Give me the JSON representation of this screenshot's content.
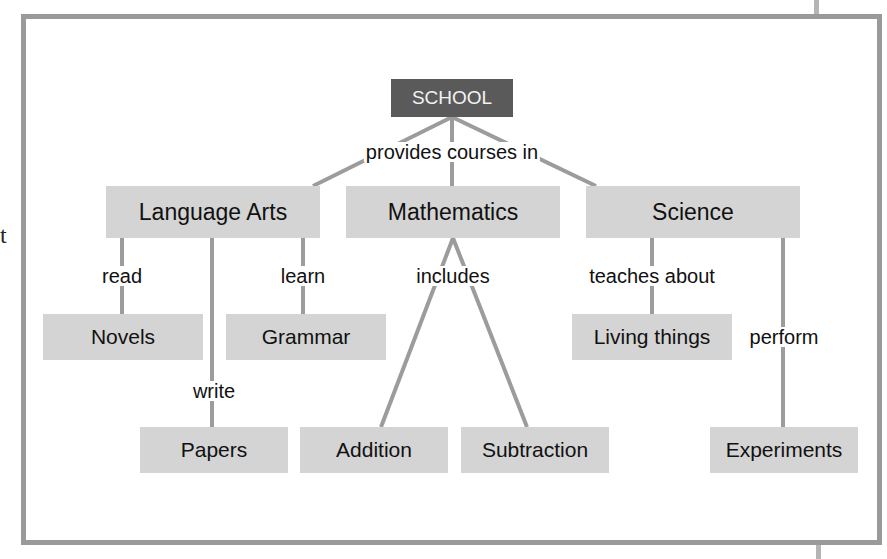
{
  "diagram": {
    "type": "concept-map",
    "colors": {
      "frame": "#9a9a9a",
      "node_fill": "#d4d4d4",
      "root_fill": "#5a5a5a",
      "root_text": "#f2f2f2",
      "link": "#999999"
    },
    "stray_text": "t",
    "root": {
      "id": "school",
      "label": "SCHOOL"
    },
    "nodes": {
      "language_arts": "Language Arts",
      "mathematics": "Mathematics",
      "science": "Science",
      "novels": "Novels",
      "grammar": "Grammar",
      "papers": "Papers",
      "addition": "Addition",
      "subtraction": "Subtraction",
      "living_things": "Living things",
      "experiments": "Experiments"
    },
    "link_labels": {
      "provides": "provides courses in",
      "read": "read",
      "write": "write",
      "learn": "learn",
      "includes": "includes",
      "teaches": "teaches about",
      "perform": "perform"
    },
    "edges": [
      {
        "from": "SCHOOL",
        "to": "Language Arts",
        "label": "provides courses in"
      },
      {
        "from": "SCHOOL",
        "to": "Mathematics",
        "label": "provides courses in"
      },
      {
        "from": "SCHOOL",
        "to": "Science",
        "label": "provides courses in"
      },
      {
        "from": "Language Arts",
        "to": "Novels",
        "label": "read"
      },
      {
        "from": "Language Arts",
        "to": "Papers",
        "label": "write"
      },
      {
        "from": "Language Arts",
        "to": "Grammar",
        "label": "learn"
      },
      {
        "from": "Mathematics",
        "to": "Addition",
        "label": "includes"
      },
      {
        "from": "Mathematics",
        "to": "Subtraction",
        "label": "includes"
      },
      {
        "from": "Science",
        "to": "Living things",
        "label": "teaches about"
      },
      {
        "from": "Science",
        "to": "Experiments",
        "label": "perform"
      }
    ]
  }
}
